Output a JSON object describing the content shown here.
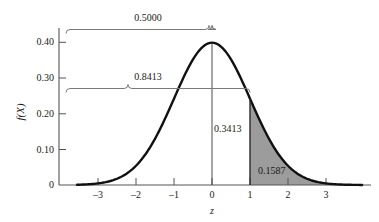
{
  "chart_data": {
    "type": "area",
    "title": "",
    "subtitle": "",
    "xlabel": "z",
    "ylabel": "f(X)",
    "xlim": [
      -3.6,
      3.8
    ],
    "ylim": [
      0,
      0.42
    ],
    "grid": false,
    "legend": null,
    "distribution": "standard normal (mean 0, sd 1)",
    "x_ticks": [
      {
        "value": -3,
        "label": "–3"
      },
      {
        "value": -2,
        "label": "–2"
      },
      {
        "value": -1,
        "label": "–1"
      },
      {
        "value": 0,
        "label": "0"
      },
      {
        "value": 1,
        "label": "1"
      },
      {
        "value": 2,
        "label": "2"
      },
      {
        "value": 3,
        "label": "3"
      }
    ],
    "y_ticks": [
      {
        "value": 0,
        "label": "0"
      },
      {
        "value": 0.1,
        "label": "0.10"
      },
      {
        "value": 0.2,
        "label": "0.20"
      },
      {
        "value": 0.3,
        "label": "0.30"
      },
      {
        "value": 0.4,
        "label": "0.40"
      }
    ],
    "series": [
      {
        "name": "standard normal density",
        "x": [
          -3.6,
          -3.4,
          -3.2,
          -3.0,
          -2.8,
          -2.6,
          -2.4,
          -2.2,
          -2.0,
          -1.8,
          -1.6,
          -1.4,
          -1.2,
          -1.0,
          -0.8,
          -0.6,
          -0.4,
          -0.2,
          0.0,
          0.2,
          0.4,
          0.6,
          0.8,
          1.0,
          1.2,
          1.4,
          1.6,
          1.8,
          2.0,
          2.2,
          2.4,
          2.6,
          2.8,
          3.0,
          3.2,
          3.4,
          3.6
        ],
        "values": [
          0.0006,
          0.0012,
          0.0024,
          0.0044,
          0.0079,
          0.0136,
          0.0224,
          0.0355,
          0.054,
          0.079,
          0.1109,
          0.1497,
          0.1942,
          0.242,
          0.2897,
          0.3332,
          0.3683,
          0.391,
          0.3989,
          0.391,
          0.3683,
          0.3332,
          0.2897,
          0.242,
          0.1942,
          0.1497,
          0.1109,
          0.079,
          0.054,
          0.0355,
          0.0224,
          0.0136,
          0.0079,
          0.0044,
          0.0024,
          0.0012,
          0.0006
        ]
      }
    ],
    "shaded_regions": [
      {
        "name": "right-tail-shaded-area",
        "from": 1.0,
        "to": 3.8,
        "area": 0.1587,
        "color": "#9c9c9c"
      }
    ],
    "annotations": [
      {
        "name": "area-right-tail",
        "text": "0.1587",
        "area": 0.1587,
        "z_from": 1.0,
        "z_to": "infinity"
      },
      {
        "name": "area-zero-to-one",
        "text": "0.3413",
        "area": 0.3413,
        "z_from": 0.0,
        "z_to": 1.0
      },
      {
        "name": "brace-half-area",
        "text": "0.5000",
        "area": 0.5,
        "z_from": "-infinity",
        "z_to": 0.0
      },
      {
        "name": "brace-cumulative-to-one",
        "text": "0.8413",
        "area": 0.8413,
        "z_from": "-infinity",
        "z_to": 1.0
      }
    ],
    "colors": {
      "curve": "#111111",
      "axis": "#555555",
      "shading": "#9c9c9c",
      "brace": "#7a7a7a",
      "background": "#ffffff"
    }
  },
  "labels": {
    "y_axis_title": "f(X)",
    "x_axis_title": "z",
    "y_tick_0": "0",
    "y_tick_010": "0.10",
    "y_tick_020": "0.20",
    "y_tick_030": "0.30",
    "y_tick_040": "0.40",
    "x_tick_neg3": "–3",
    "x_tick_neg2": "–2",
    "x_tick_neg1": "–1",
    "x_tick_0": "0",
    "x_tick_1": "1",
    "x_tick_2": "2",
    "x_tick_3": "3",
    "annotation_half": "0.5000",
    "annotation_cumulative": "0.8413",
    "annotation_mid": "0.3413",
    "annotation_tail": "0.1587"
  }
}
